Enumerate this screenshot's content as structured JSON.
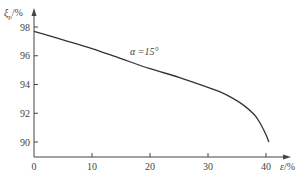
{
  "chart_data": {
    "type": "line",
    "title": "",
    "xlabel": "ε/%",
    "ylabel": "ξp/%",
    "xlim": [
      0,
      42
    ],
    "ylim": [
      89,
      98.8
    ],
    "xticks": [
      0,
      10,
      20,
      30,
      40
    ],
    "yticks": [
      90,
      92,
      94,
      96,
      98
    ],
    "grid": false,
    "legend": null,
    "annotations": [
      {
        "text": "α=15°",
        "x": 20,
        "y": 95.5
      }
    ],
    "series": [
      {
        "name": "α=15°",
        "x": [
          0,
          5,
          10,
          15,
          20,
          25,
          30,
          32,
          34,
          36,
          38,
          39,
          40,
          40.5
        ],
        "y": [
          97.7,
          97.1,
          96.5,
          95.8,
          95.1,
          94.5,
          93.8,
          93.5,
          93.1,
          92.6,
          91.9,
          91.3,
          90.5,
          90.0
        ]
      }
    ]
  },
  "axes": {
    "y_label_main": "ξ",
    "y_label_sub": "p",
    "y_label_unit": "/%",
    "x_label_main": "ε",
    "x_label_unit": "/%",
    "x_tick_labels": [
      "0",
      "10",
      "20",
      "30",
      "40"
    ],
    "y_tick_labels": [
      "90",
      "92",
      "94",
      "96",
      "98"
    ]
  },
  "annotation": {
    "text": "α =15°"
  }
}
